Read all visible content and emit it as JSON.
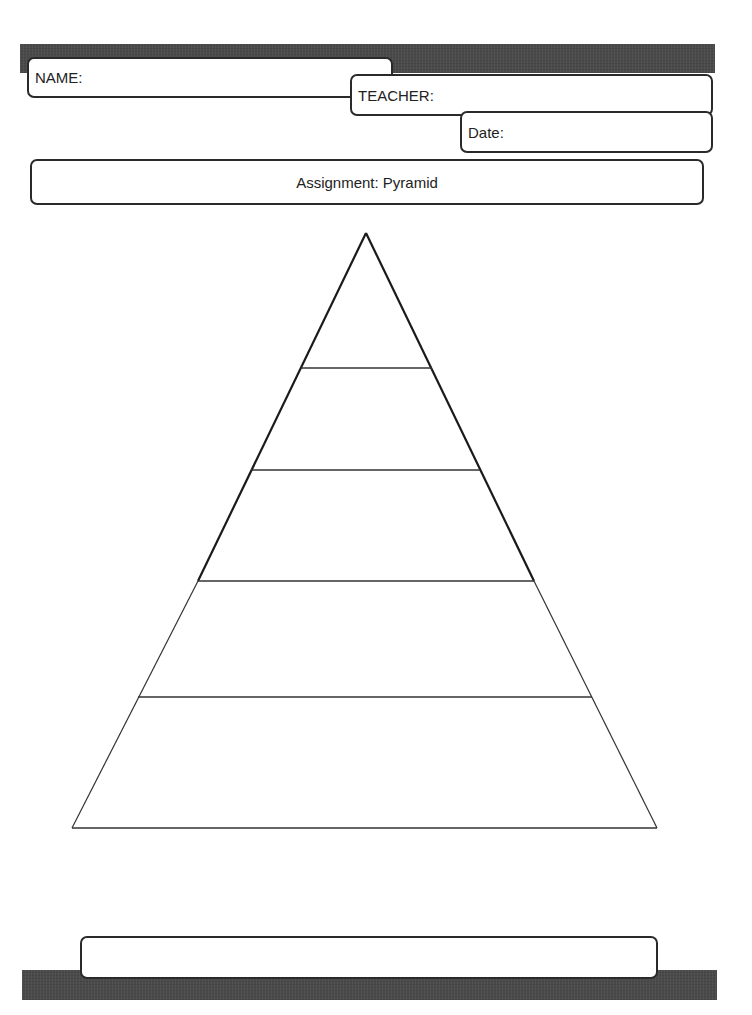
{
  "header": {
    "name_label": "NAME:",
    "teacher_label": "TEACHER:",
    "date_label": "Date:",
    "assignment_label": "Assignment: Pyramid"
  },
  "footer": {
    "text": ""
  },
  "pyramid": {
    "tiers": 5,
    "apex": [
      366,
      233
    ],
    "base_left": [
      72,
      828
    ],
    "base_right": [
      657,
      828
    ],
    "dividers_y": [
      368,
      470,
      581,
      697
    ]
  },
  "colors": {
    "bar": "#4a4a4a",
    "border": "#2a2a2a",
    "background": "#ffffff"
  }
}
